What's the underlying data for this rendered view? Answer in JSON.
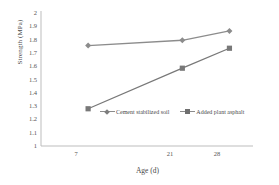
{
  "chart_data": {
    "type": "line",
    "title": "",
    "xlabel": "Age (d)",
    "ylabel": "Strength (MPa)",
    "categories": [
      "7",
      "21",
      "28"
    ],
    "x": [
      7,
      21,
      28
    ],
    "xlim": [
      0,
      31.5
    ],
    "ylim": [
      1,
      2
    ],
    "ytick_labels": [
      "1",
      "1.1",
      "1.2",
      "1.3",
      "1.4",
      "1.5",
      "1.6",
      "1.7",
      "1.8",
      "1.9",
      "2"
    ],
    "ytick_values": [
      1,
      1.1,
      1.2,
      1.3,
      1.4,
      1.5,
      1.6,
      1.7,
      1.8,
      1.9,
      2
    ],
    "grid": false,
    "legend_position": "inside-lower-center",
    "series": [
      {
        "name": "Cement stabilized soil",
        "marker": "diamond",
        "color": "#8c8c8c",
        "values": [
          1.755,
          1.795,
          1.865
        ]
      },
      {
        "name": "Added plant asphalt",
        "marker": "square",
        "color": "#787878",
        "values": [
          1.28,
          1.585,
          1.735
        ]
      }
    ]
  },
  "axes": {
    "y_title": "Strength (MPa)",
    "x_title": "Age (d)",
    "y_ticks": [
      "2",
      "1.9",
      "1.8",
      "1.7",
      "1.6",
      "1.5",
      "1.4",
      "1.3",
      "1.2",
      "1.1",
      "1"
    ],
    "x_ticks": [
      "7",
      "21",
      "28"
    ]
  },
  "legend": {
    "entries": [
      {
        "label": "Cement stabilized soil",
        "marker": "diamond-marker",
        "color": "#8c8c8c"
      },
      {
        "label": "Added plant asphalt",
        "marker": "square-marker",
        "color": "#787878"
      }
    ]
  },
  "watermark": {
    "text": ""
  },
  "colors": {
    "series_1": "#8c8c8c",
    "series_2": "#787878",
    "axis": "#b9b9b9",
    "text": "#4a4a4a",
    "background": "#ffffff"
  }
}
